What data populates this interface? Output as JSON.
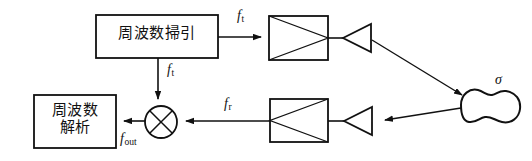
{
  "diagram": {
    "stroke_color": "#111111",
    "background_color": "#ffffff",
    "blocks": [
      {
        "id": "sweep",
        "label": "周波数掃引",
        "shape": "rectangle",
        "x": 96,
        "y": 15,
        "w": 122,
        "h": 43
      },
      {
        "id": "analyze",
        "label_line1": "周波数",
        "label_line2": "解析",
        "shape": "rectangle",
        "x": 34,
        "y": 95,
        "w": 82,
        "h": 53
      }
    ],
    "amplifiers": [
      {
        "id": "tx-amp",
        "shape": "box-with-triangle-right",
        "x": 269,
        "y": 16,
        "w": 59,
        "h": 44
      },
      {
        "id": "rx-amp",
        "shape": "box-with-triangle-left",
        "x": 270,
        "y": 99,
        "w": 58,
        "h": 43
      }
    ],
    "antennas": [
      {
        "id": "tx-antenna",
        "shape": "triangle-pointing-left",
        "x": 343,
        "y": 24,
        "w": 28,
        "h": 28
      },
      {
        "id": "rx-antenna",
        "shape": "triangle-pointing-left",
        "x": 344,
        "y": 107,
        "w": 28,
        "h": 28
      }
    ],
    "mixer": {
      "id": "mixer",
      "shape": "circle-with-cross",
      "cx": 161,
      "cy": 122,
      "r": 16
    },
    "target": {
      "id": "target",
      "shape": "peanut-blob",
      "label": "σ",
      "cx": 487,
      "cy": 108
    },
    "signal_labels": {
      "ft_top": {
        "base": "f",
        "sub": "t"
      },
      "ft_down": {
        "base": "f",
        "sub": "t"
      },
      "fr": {
        "base": "f",
        "sub": "r"
      },
      "fout": {
        "base": "f",
        "sub": "out"
      },
      "sigma": "σ"
    },
    "connections": [
      {
        "from": "sweep",
        "to": "tx-amp",
        "label": "f_t",
        "direction": "right"
      },
      {
        "from": "sweep",
        "to": "mixer",
        "label": "f_t",
        "direction": "down"
      },
      {
        "from": "tx-amp",
        "to": "tx-antenna",
        "label": "",
        "direction": "right"
      },
      {
        "from": "tx-antenna",
        "to": "target",
        "label": "",
        "direction": "diagonal-down-right"
      },
      {
        "from": "target",
        "to": "rx-antenna",
        "label": "",
        "direction": "left"
      },
      {
        "from": "rx-antenna",
        "to": "rx-amp",
        "label": "",
        "direction": "left"
      },
      {
        "from": "rx-amp",
        "to": "mixer",
        "label": "f_r",
        "direction": "left"
      },
      {
        "from": "mixer",
        "to": "analyze",
        "label": "f_out",
        "direction": "left"
      }
    ]
  }
}
